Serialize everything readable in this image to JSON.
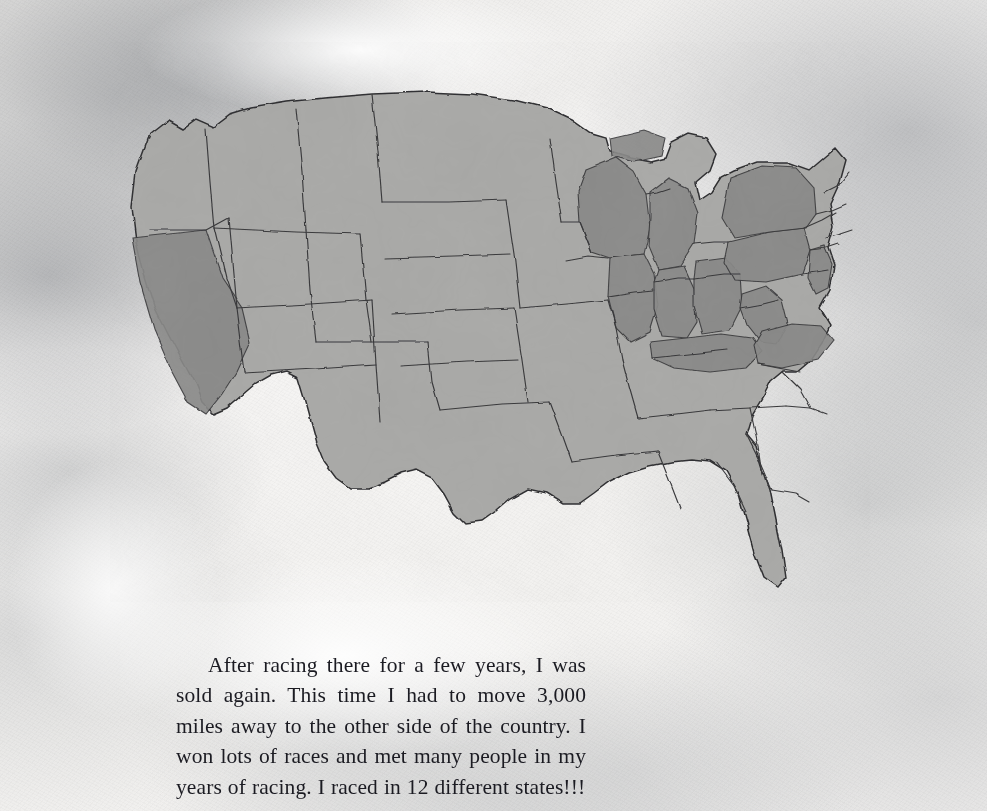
{
  "page": {
    "type": "illustrated-book-page",
    "orientation": "landscape",
    "medium": "watercolor",
    "paper_tone": "#f3f2f0"
  },
  "story": {
    "paragraph": "After racing there for a few years, I was sold again. This time I had to move 3,000 miles away to the other side of the country. I won lots of races and met many people in my years of racing. I raced in 12 different states!!!",
    "text_color": "#1b1b22"
  },
  "map": {
    "title": "United States watercolor map",
    "base_fill": "#a9a9a7",
    "highlight_fill": "#898988",
    "border_stroke": "#3a3a3c",
    "coast_stroke": "#2e2e30",
    "highlight_count": 12,
    "highlighted_states": [
      "California",
      "Wisconsin",
      "Michigan",
      "Illinois",
      "Indiana",
      "Ohio",
      "Kentucky",
      "West Virginia",
      "Virginia",
      "Pennsylvania",
      "New York",
      "New Jersey"
    ],
    "unhighlighted_states": [
      "Washington",
      "Oregon",
      "Idaho",
      "Nevada",
      "Montana",
      "Wyoming",
      "Utah",
      "Arizona",
      "Colorado",
      "New Mexico",
      "North Dakota",
      "South Dakota",
      "Nebraska",
      "Kansas",
      "Oklahoma",
      "Texas",
      "Minnesota",
      "Iowa",
      "Missouri",
      "Arkansas",
      "Louisiana",
      "Mississippi",
      "Alabama",
      "Tennessee",
      "Florida",
      "Georgia",
      "South Carolina",
      "North Carolina",
      "Maryland",
      "Delaware",
      "Vermont",
      "New Hampshire",
      "Maine",
      "Massachusetts",
      "Connecticut",
      "Rhode Island"
    ]
  }
}
